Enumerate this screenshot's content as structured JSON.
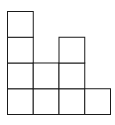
{
  "diagram": {
    "type": "polyomino-grid",
    "columns": [
      {
        "index": 1,
        "height": 4
      },
      {
        "index": 2,
        "height": 2
      },
      {
        "index": 3,
        "height": 3
      },
      {
        "index": 4,
        "height": 1
      }
    ],
    "max_height": 4,
    "total_squares": 10,
    "colors": {
      "stroke": "#1a1a1a",
      "fill": "#ffffff"
    }
  },
  "caption": {
    "text": ""
  }
}
